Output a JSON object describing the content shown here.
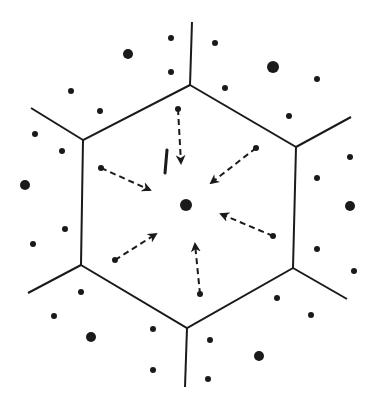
{
  "diagram": {
    "colors": {
      "ink": "#1a1a1a",
      "background": "#ffffff"
    },
    "hexagon": [
      [
        190,
        85
      ],
      [
        296,
        147
      ],
      [
        293,
        268
      ],
      [
        187,
        328
      ],
      [
        81,
        265
      ],
      [
        83,
        140
      ]
    ],
    "outer_edges": [
      {
        "from": [
          190,
          85
        ],
        "to": [
          192,
          22
        ]
      },
      {
        "from": [
          296,
          147
        ],
        "to": [
          351,
          117
        ]
      },
      {
        "from": [
          293,
          268
        ],
        "to": [
          347,
          299
        ]
      },
      {
        "from": [
          187,
          328
        ],
        "to": [
          185,
          387
        ]
      },
      {
        "from": [
          81,
          265
        ],
        "to": [
          28,
          293
        ]
      },
      {
        "from": [
          83,
          140
        ],
        "to": [
          31,
          108
        ]
      }
    ],
    "center_dot": {
      "x": 186,
      "y": 205,
      "r": 6
    },
    "arrows": [
      {
        "from": [
          178,
          109
        ],
        "to": [
          181,
          163
        ]
      },
      {
        "from": [
          256,
          148
        ],
        "to": [
          211,
          183
        ]
      },
      {
        "from": [
          273,
          236
        ],
        "to": [
          221,
          214
        ]
      },
      {
        "from": [
          200,
          294
        ],
        "to": [
          195,
          244
        ]
      },
      {
        "from": [
          115,
          260
        ],
        "to": [
          156,
          234
        ]
      },
      {
        "from": [
          101,
          168
        ],
        "to": [
          150,
          190
        ]
      }
    ],
    "short_mark": {
      "from": [
        167,
        150
      ],
      "to": [
        165,
        173
      ]
    },
    "dots": [
      {
        "x": 171,
        "y": 38,
        "r": 3
      },
      {
        "x": 128,
        "y": 54,
        "r": 5
      },
      {
        "x": 171,
        "y": 72,
        "r": 3
      },
      {
        "x": 215,
        "y": 43,
        "r": 3
      },
      {
        "x": 273,
        "y": 67,
        "r": 6
      },
      {
        "x": 225,
        "y": 88,
        "r": 3
      },
      {
        "x": 317,
        "y": 79,
        "r": 3
      },
      {
        "x": 289,
        "y": 116,
        "r": 3
      },
      {
        "x": 71,
        "y": 91,
        "r": 3
      },
      {
        "x": 100,
        "y": 111,
        "r": 3
      },
      {
        "x": 35,
        "y": 134,
        "r": 3
      },
      {
        "x": 62,
        "y": 151,
        "r": 3
      },
      {
        "x": 25,
        "y": 185,
        "r": 5
      },
      {
        "x": 65,
        "y": 229,
        "r": 3
      },
      {
        "x": 33,
        "y": 244,
        "r": 3
      },
      {
        "x": 350,
        "y": 157,
        "r": 3
      },
      {
        "x": 317,
        "y": 178,
        "r": 3
      },
      {
        "x": 350,
        "y": 206,
        "r": 5
      },
      {
        "x": 317,
        "y": 249,
        "r": 3
      },
      {
        "x": 354,
        "y": 271,
        "r": 3
      },
      {
        "x": 81,
        "y": 292,
        "r": 3
      },
      {
        "x": 54,
        "y": 316,
        "r": 3
      },
      {
        "x": 91,
        "y": 337,
        "r": 5
      },
      {
        "x": 153,
        "y": 329,
        "r": 3
      },
      {
        "x": 153,
        "y": 370,
        "r": 3
      },
      {
        "x": 277,
        "y": 298,
        "r": 3
      },
      {
        "x": 311,
        "y": 315,
        "r": 3
      },
      {
        "x": 210,
        "y": 340,
        "r": 3
      },
      {
        "x": 259,
        "y": 356,
        "r": 5
      },
      {
        "x": 208,
        "y": 379,
        "r": 3
      }
    ]
  }
}
